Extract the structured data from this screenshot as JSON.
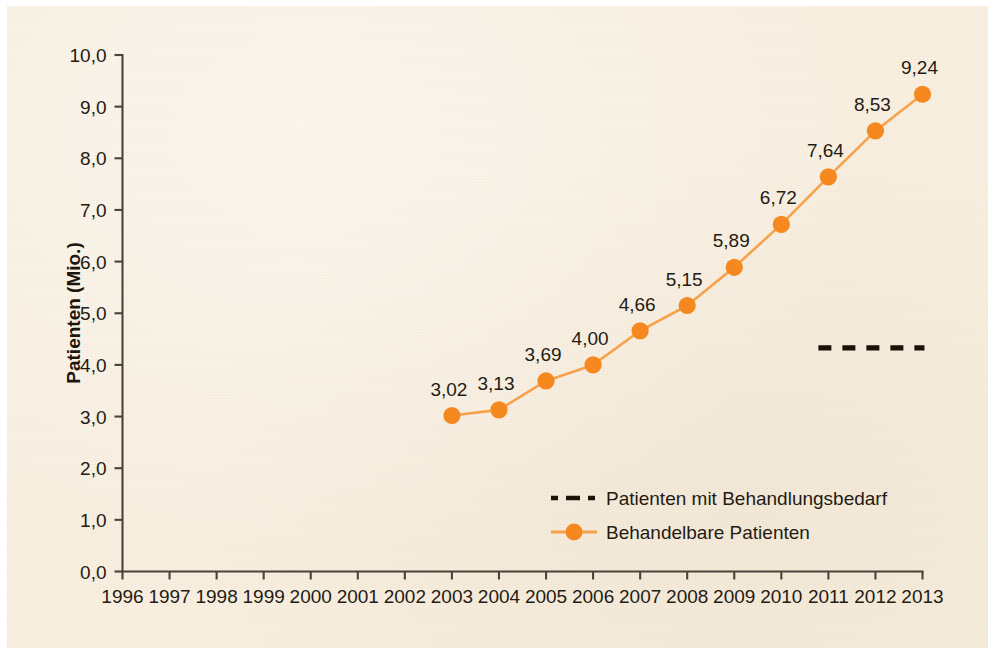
{
  "chart_data": {
    "type": "line",
    "title": "",
    "xlabel": "",
    "ylabel": "Patienten (Mio.)",
    "categories": [
      "1996",
      "1997",
      "1998",
      "1999",
      "2000",
      "2001",
      "2002",
      "2003",
      "2004",
      "2005",
      "2006",
      "2007",
      "2008",
      "2009",
      "2010",
      "2011",
      "2012",
      "2013"
    ],
    "ylim": [
      0,
      10
    ],
    "ytick_labels": [
      "0,0",
      "1,0",
      "2,0",
      "3,0",
      "4,0",
      "5,0",
      "6,0",
      "7,0",
      "8,0",
      "9,0",
      "10,0"
    ],
    "ytick_values": [
      0,
      1,
      2,
      3,
      4,
      5,
      6,
      7,
      8,
      9,
      10
    ],
    "grid": false,
    "legend_position": "inside-bottom-center",
    "decimal_separator": ",",
    "series": [
      {
        "name": "Behandelbare Patienten",
        "style": "solid-line-with-round-markers",
        "color": "#f5881f",
        "line_color": "#f7a24b",
        "x": [
          "2003",
          "2004",
          "2005",
          "2006",
          "2007",
          "2008",
          "2009",
          "2010",
          "2011",
          "2012",
          "2013"
        ],
        "values": [
          3.02,
          3.13,
          3.69,
          4.0,
          4.66,
          5.15,
          5.89,
          6.72,
          7.64,
          8.53,
          9.24
        ],
        "data_labels": [
          "3,02",
          "3,13",
          "3,69",
          "4,00",
          "4,66",
          "5,15",
          "5,89",
          "6,72",
          "7,64",
          "8,53",
          "9,24"
        ]
      },
      {
        "name": "Patienten mit Behandlungsbedarf",
        "style": "dashed-line",
        "color": "#1d1108",
        "x": [
          "2011",
          "2013"
        ],
        "values": [
          4.33,
          4.33
        ],
        "data_labels": []
      }
    ],
    "legend": [
      {
        "label": "Patienten mit Behandlungsbedarf",
        "marker": "dashed-line",
        "color": "#1d1108"
      },
      {
        "label": "Behandelbare Patienten",
        "marker": "line-with-circle",
        "color": "#f5881f"
      }
    ]
  },
  "colors": {
    "background": "#f8efe0",
    "accent_orange": "#f5881f",
    "line_orange": "#f7a24b",
    "axis": "#4b433a",
    "text": "#241b13"
  }
}
